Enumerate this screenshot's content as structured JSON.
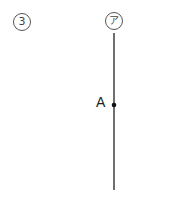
{
  "problem_number": "3",
  "line": {
    "label": "ア",
    "color": "#222222"
  },
  "point": {
    "label": "A"
  }
}
